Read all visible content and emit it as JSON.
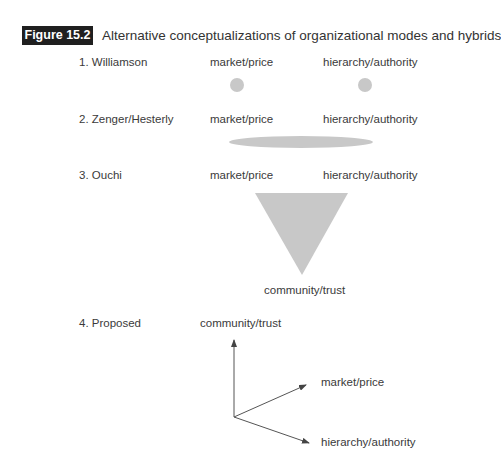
{
  "figure": {
    "number_label": "Figure 15.2",
    "title": "Alternative conceptualizations of organizational modes and hybrids"
  },
  "rows": [
    {
      "label": "1. Williamson",
      "left_label": "market/price",
      "right_label": "hierarchy/authority",
      "shape": "two-circles"
    },
    {
      "label": "2. Zenger/Hesterly",
      "left_label": "market/price",
      "right_label": "hierarchy/authority",
      "shape": "ellipse"
    },
    {
      "label": "3. Ouchi",
      "left_label": "market/price",
      "right_label": "hierarchy/authority",
      "bottom_label": "community/trust",
      "shape": "inverted-triangle"
    },
    {
      "label": "4. Proposed",
      "top_label": "community/trust",
      "axis1_label": "market/price",
      "axis2_label": "hierarchy/authority",
      "shape": "three-axes"
    }
  ],
  "colors": {
    "shape_fill": "#c8c8c8",
    "text": "#333333",
    "label_bg": "#1f1f1f",
    "arrow": "#555555"
  }
}
